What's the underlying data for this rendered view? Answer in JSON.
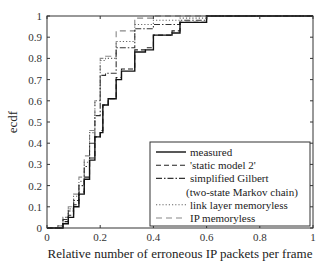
{
  "chart_data": {
    "type": "line",
    "subtype": "step (ecdf)",
    "title": "",
    "xlabel": "Relative number of erroneous IP packets per frame",
    "ylabel": "ecdf",
    "xlim": [
      0,
      1
    ],
    "ylim": [
      0,
      1
    ],
    "x_ticks": [
      0,
      0.2,
      0.4,
      0.6,
      0.8,
      1
    ],
    "x_tick_labels": [
      "0",
      "0.2",
      "0.4",
      "0.6",
      "0.8",
      "1"
    ],
    "y_ticks": [
      0,
      0.1,
      0.2,
      0.3,
      0.4,
      0.5,
      0.6,
      0.7,
      0.8,
      0.9,
      1
    ],
    "y_tick_labels": [
      "0",
      "0.1",
      "0.2",
      "0.3",
      "0.4",
      "0.5",
      "0.6",
      "0.7",
      "0.8",
      "0.9",
      "1"
    ],
    "grid": false,
    "legend_position": "lower right",
    "series": [
      {
        "name": "measured",
        "style": "solid",
        "color": "#111111",
        "x": [
          0,
          0.04,
          0.06,
          0.08,
          0.1,
          0.12,
          0.14,
          0.16,
          0.18,
          0.2,
          0.21,
          0.23,
          0.26,
          0.28,
          0.33,
          0.37,
          0.4,
          0.47,
          0.5,
          0.6,
          1.0
        ],
        "y": [
          0,
          0.0,
          0.02,
          0.05,
          0.1,
          0.16,
          0.23,
          0.32,
          0.43,
          0.45,
          0.58,
          0.61,
          0.7,
          0.74,
          0.83,
          0.84,
          0.91,
          0.92,
          0.97,
          1.0,
          1.0
        ]
      },
      {
        "name": "'static model 2'",
        "style": "dashed",
        "color": "#222222",
        "x": [
          0,
          0.04,
          0.06,
          0.08,
          0.1,
          0.12,
          0.14,
          0.16,
          0.18,
          0.2,
          0.21,
          0.23,
          0.26,
          0.28,
          0.33,
          0.37,
          0.4,
          0.47,
          0.5,
          0.6,
          1.0
        ],
        "y": [
          0,
          0.0,
          0.03,
          0.06,
          0.11,
          0.17,
          0.24,
          0.33,
          0.43,
          0.46,
          0.58,
          0.61,
          0.71,
          0.75,
          0.84,
          0.85,
          0.91,
          0.93,
          0.97,
          1.0,
          1.0
        ]
      },
      {
        "name": "simplified Gilbert (two-state Markov chain)",
        "style": "dashdot",
        "color": "#333333",
        "x": [
          0,
          0.04,
          0.06,
          0.08,
          0.1,
          0.12,
          0.14,
          0.16,
          0.18,
          0.2,
          0.22,
          0.26,
          0.33,
          0.4,
          0.5,
          0.6,
          1.0
        ],
        "y": [
          0,
          0.0,
          0.04,
          0.08,
          0.13,
          0.2,
          0.29,
          0.4,
          0.53,
          0.72,
          0.73,
          0.85,
          0.94,
          0.96,
          0.98,
          1.0,
          1.0
        ]
      },
      {
        "name": "link layer memoryless",
        "style": "dotted",
        "color": "#666666",
        "x": [
          0,
          0.04,
          0.06,
          0.08,
          0.1,
          0.12,
          0.14,
          0.16,
          0.18,
          0.2,
          0.22,
          0.26,
          0.33,
          0.4,
          0.5,
          0.6,
          1.0
        ],
        "y": [
          0,
          0.01,
          0.05,
          0.09,
          0.15,
          0.22,
          0.31,
          0.45,
          0.6,
          0.79,
          0.8,
          0.88,
          0.96,
          0.98,
          0.99,
          1.0,
          1.0
        ]
      },
      {
        "name": "IP memoryless",
        "style": "dashed-light",
        "color": "#888888",
        "x": [
          0,
          0.04,
          0.06,
          0.08,
          0.1,
          0.12,
          0.14,
          0.16,
          0.18,
          0.2,
          0.22,
          0.26,
          0.33,
          0.4,
          0.5,
          0.6,
          1.0
        ],
        "y": [
          0,
          0.01,
          0.05,
          0.1,
          0.16,
          0.24,
          0.34,
          0.46,
          0.6,
          0.8,
          0.81,
          0.93,
          0.99,
          1.0,
          1.0,
          1.0,
          1.0
        ]
      }
    ]
  },
  "layout": {
    "plot": {
      "left": 47,
      "top": 16,
      "width": 266,
      "height": 212
    },
    "legend": {
      "x": 150,
      "y": 142,
      "width": 160,
      "height": 84
    }
  }
}
